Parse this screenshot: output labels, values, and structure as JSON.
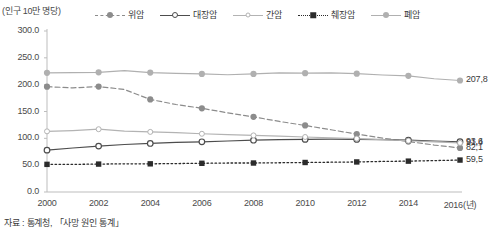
{
  "chart_data": {
    "type": "line",
    "title": "",
    "subtitle": "",
    "unit_label": "(인구 10만 명당)",
    "xlabel": "",
    "ylabel": "",
    "x_axis_suffix": "(년)",
    "x": [
      2000,
      2001,
      2002,
      2003,
      2004,
      2005,
      2006,
      2007,
      2008,
      2009,
      2010,
      2011,
      2012,
      2013,
      2014,
      2015,
      2016
    ],
    "xticks": [
      "2000",
      "2002",
      "2004",
      "2006",
      "2008",
      "2010",
      "2012",
      "2014",
      "2016(년)"
    ],
    "xtick_values": [
      2000,
      2002,
      2004,
      2006,
      2008,
      2010,
      2012,
      2014,
      2016
    ],
    "yticks": [
      "0.0",
      "50.0",
      "100.0",
      "150.0",
      "200.0",
      "250.0",
      "300.0"
    ],
    "ytick_values": [
      0,
      50,
      100,
      150,
      200,
      250,
      300
    ],
    "ylim": [
      0,
      300
    ],
    "xlim": [
      2000,
      2016
    ],
    "grid": false,
    "legend_position": "top",
    "series": [
      {
        "name": "위암",
        "key": "stomach",
        "color": "#8c8c8c",
        "line_style": "dashed",
        "marker": "disc",
        "end_value": "82,1",
        "values": [
          196.3,
          194.0,
          196.5,
          191.0,
          172.5,
          163.0,
          156.0,
          147.5,
          140.0,
          131.5,
          124.0,
          116.0,
          108.0,
          100.5,
          94.0,
          87.5,
          82.1
        ]
      },
      {
        "name": "대장암",
        "key": "colorectal",
        "color": "#4d4d4d",
        "line_style": "solid",
        "marker": "ring",
        "end_value": "93,6",
        "values": [
          78.0,
          82.0,
          85.5,
          88.5,
          90.5,
          92.5,
          93.5,
          95.0,
          96.5,
          97.5,
          98.0,
          98.5,
          98.0,
          97.5,
          96.5,
          95.0,
          93.6
        ]
      },
      {
        "name": "간암",
        "key": "liver",
        "color": "#b3b3b3",
        "line_style": "solid",
        "marker": "ring-sm",
        "end_value": "91,4",
        "values": [
          113.0,
          114.5,
          117.0,
          113.5,
          112.0,
          110.5,
          108.5,
          107.0,
          105.5,
          104.0,
          102.5,
          101.0,
          99.5,
          97.5,
          95.5,
          93.5,
          91.4
        ]
      },
      {
        "name": "췌장암",
        "key": "pancreatic",
        "color": "#2b2b2b",
        "line_style": "dotted",
        "marker": "square",
        "end_value": "59,5",
        "values": [
          51.5,
          51.5,
          52.0,
          52.5,
          52.5,
          53.0,
          53.5,
          54.0,
          54.0,
          54.5,
          55.0,
          55.5,
          56.0,
          57.0,
          57.5,
          58.5,
          59.5
        ]
      },
      {
        "name": "폐암",
        "key": "lung",
        "color": "#b0b0b0",
        "line_style": "solid",
        "marker": "disc",
        "end_value": "207,8",
        "values": [
          222.0,
          222.5,
          223.0,
          226.0,
          222.5,
          221.0,
          220.0,
          218.5,
          220.0,
          222.0,
          221.5,
          222.0,
          220.5,
          218.0,
          216.5,
          211.0,
          207.8
        ]
      }
    ]
  },
  "source": {
    "note": "자료 : 통계청, 「사망 원인 통계」"
  }
}
